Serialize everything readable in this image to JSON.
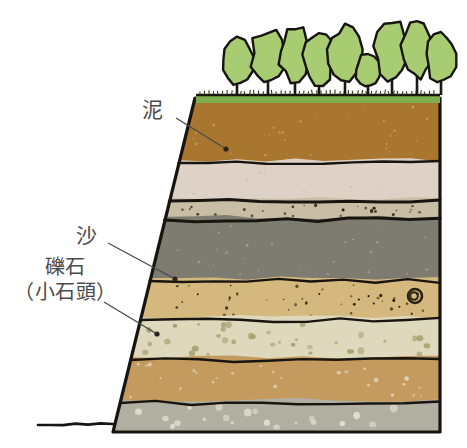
{
  "figure": {
    "background_color": "#ffffff",
    "outline_color": "#181510",
    "width": 467,
    "height": 448
  },
  "labels": [
    {
      "id": "mud",
      "text": "泥",
      "meaning": "mud",
      "x": 142,
      "y": 98,
      "leader_from": [
        176,
        118
      ],
      "leader_to": [
        226,
        149
      ]
    },
    {
      "id": "sand",
      "text": "沙",
      "meaning": "sand",
      "x": 76,
      "y": 224,
      "leader_from": [
        108,
        243
      ],
      "leader_to": [
        175,
        279
      ]
    },
    {
      "id": "gravel",
      "text_line1": "礫石",
      "text_line2": "（小石頭）",
      "meaning": "gravel (small stones)",
      "x": 14,
      "y": 256,
      "leader_from": [
        104,
        302
      ],
      "leader_to": [
        157,
        334
      ]
    }
  ],
  "ground_line": {
    "name": "ground-surface-line",
    "from_x": 38,
    "to_x": 113,
    "y": 424
  },
  "grass": {
    "name": "grass-strip",
    "color": "#7fae4e",
    "top": 95,
    "height": 8
  },
  "trees": {
    "count": 10,
    "canopy_color": "#a8cc72",
    "trunk_color": "#1b1711",
    "outline_color": "#181510",
    "items": [
      {
        "cx": 237,
        "cy": 62,
        "rx": 16,
        "ry": 24,
        "trunk_h": 29
      },
      {
        "cx": 268,
        "cy": 56,
        "rx": 17,
        "ry": 28,
        "trunk_h": 24
      },
      {
        "cx": 295,
        "cy": 54,
        "rx": 16,
        "ry": 27,
        "trunk_h": 26
      },
      {
        "cx": 319,
        "cy": 58,
        "rx": 15,
        "ry": 26,
        "trunk_h": 24
      },
      {
        "cx": 345,
        "cy": 53,
        "rx": 16,
        "ry": 27,
        "trunk_h": 27
      },
      {
        "cx": 368,
        "cy": 72,
        "rx": 13,
        "ry": 17,
        "trunk_h": 16
      },
      {
        "cx": 392,
        "cy": 50,
        "rx": 17,
        "ry": 30,
        "trunk_h": 25
      },
      {
        "cx": 417,
        "cy": 49,
        "rx": 15,
        "ry": 30,
        "trunk_h": 26
      },
      {
        "cx": 441,
        "cy": 57,
        "rx": 15,
        "ry": 26,
        "trunk_h": 22
      }
    ]
  },
  "layers": [
    {
      "index": 0,
      "name": "topsoil-brown-layer",
      "description": "mud / brown topsoil",
      "color": "#a9762f",
      "top_y": 103,
      "bottom_y": 163,
      "speck_color": "#c7a26a",
      "speck_count": 26,
      "speck_size": 2
    },
    {
      "index": 1,
      "name": "pale-beige-layer",
      "description": "fine pale silt",
      "color": "#ded2c7",
      "top_y": 163,
      "bottom_y": 201,
      "speck_color": "#cfc0b2",
      "speck_count": 14,
      "speck_size": 2
    },
    {
      "index": 2,
      "name": "thin-pebble-band",
      "description": "thin gravelly band with dark pebbles",
      "color": "#c8bda5",
      "top_y": 201,
      "bottom_y": 220,
      "speck_color": "#24200f",
      "speck_count": 26,
      "speck_size": 2.5
    },
    {
      "index": 3,
      "name": "gray-clay-layer",
      "description": "dark gray clay",
      "color": "#7e7b71",
      "top_y": 220,
      "bottom_y": 281,
      "speck_color": "#a5a29a",
      "speck_count": 28,
      "speck_size": 2.2
    },
    {
      "index": 4,
      "name": "sand-layer",
      "description": "sand with dark grains",
      "color": "#d4b87d",
      "top_y": 281,
      "bottom_y": 320,
      "speck_color": "#221c0c",
      "speck_count": 40,
      "speck_size": 2.6
    },
    {
      "index": 5,
      "name": "gravel-layer",
      "description": "gravel / small stones layer",
      "color": "#ded9bd",
      "top_y": 320,
      "bottom_y": 360,
      "speck_color": "#a8a070",
      "speck_count": 34,
      "speck_size": 5
    },
    {
      "index": 6,
      "name": "ochre-layer",
      "description": "ochre sandy layer",
      "color": "#c59a5f",
      "top_y": 360,
      "bottom_y": 403,
      "speck_color": "#ded3bd",
      "speck_count": 26,
      "speck_size": 3.5
    },
    {
      "index": 7,
      "name": "bottom-gray-cobble-layer",
      "description": "bottom gray layer with pale cobbles",
      "color": "#b1aea2",
      "top_y": 403,
      "bottom_y": 432,
      "speck_color": "#e2ded2",
      "speck_count": 20,
      "speck_size": 6
    }
  ],
  "fossil_marker": {
    "name": "snail-fossil-icon",
    "x": 415,
    "y": 296,
    "radius": 7,
    "color": "#2a2212"
  },
  "geometry": {
    "right_edge_x": 440,
    "top_left_x": 195,
    "bottom_left_x": 113,
    "top_y": 95,
    "bottom_y": 432
  }
}
